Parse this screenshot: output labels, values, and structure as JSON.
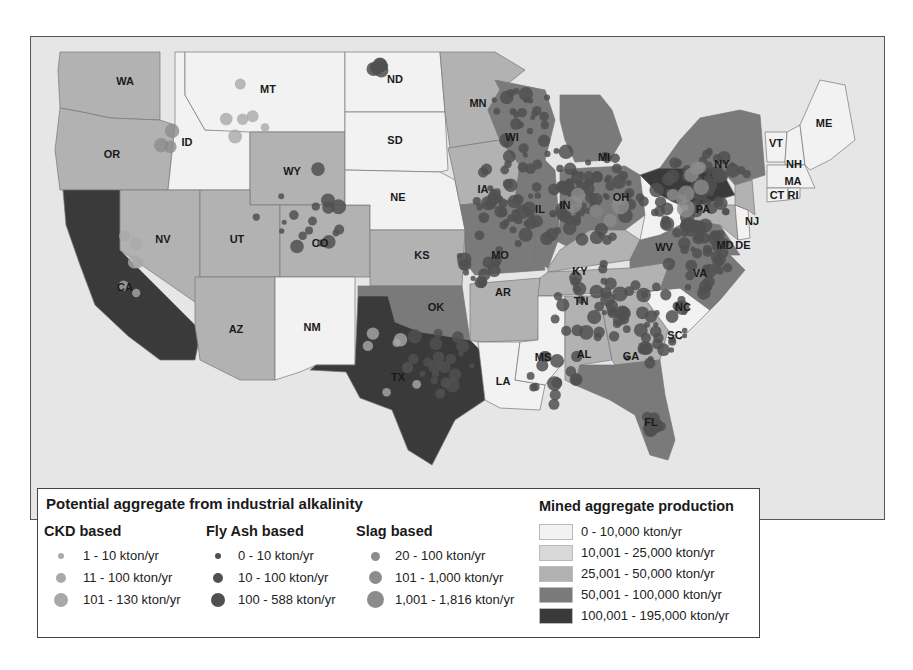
{
  "map": {
    "region": "Contiguous United States",
    "colors": {
      "background": "#e6e6e6",
      "border": "#777777",
      "cls0": "#f2f2f2",
      "cls1": "#d9d9d9",
      "cls2": "#b2b2b2",
      "cls3": "#7a7a7a",
      "cls4": "#3a3a3a",
      "ckd": "#a9a9a9",
      "flyash": "#505050",
      "slag": "#8c8c8c"
    },
    "states": [
      {
        "abbr": "WA",
        "production_class": 2
      },
      {
        "abbr": "OR",
        "production_class": 2
      },
      {
        "abbr": "CA",
        "production_class": 4
      },
      {
        "abbr": "ID",
        "production_class": 0
      },
      {
        "abbr": "NV",
        "production_class": 2
      },
      {
        "abbr": "MT",
        "production_class": 0
      },
      {
        "abbr": "WY",
        "production_class": 2
      },
      {
        "abbr": "UT",
        "production_class": 2
      },
      {
        "abbr": "CO",
        "production_class": 2
      },
      {
        "abbr": "AZ",
        "production_class": 2
      },
      {
        "abbr": "NM",
        "production_class": 0
      },
      {
        "abbr": "ND",
        "production_class": 0
      },
      {
        "abbr": "SD",
        "production_class": 0
      },
      {
        "abbr": "NE",
        "production_class": 0
      },
      {
        "abbr": "KS",
        "production_class": 2
      },
      {
        "abbr": "OK",
        "production_class": 3
      },
      {
        "abbr": "TX",
        "production_class": 4
      },
      {
        "abbr": "MN",
        "production_class": 2
      },
      {
        "abbr": "IA",
        "production_class": 2
      },
      {
        "abbr": "MO",
        "production_class": 3
      },
      {
        "abbr": "AR",
        "production_class": 2
      },
      {
        "abbr": "LA",
        "production_class": 0
      },
      {
        "abbr": "WI",
        "production_class": 3
      },
      {
        "abbr": "IL",
        "production_class": 3
      },
      {
        "abbr": "MI",
        "production_class": 3
      },
      {
        "abbr": "IN",
        "production_class": 3
      },
      {
        "abbr": "OH",
        "production_class": 3
      },
      {
        "abbr": "KY",
        "production_class": 2
      },
      {
        "abbr": "TN",
        "production_class": 2
      },
      {
        "abbr": "MS",
        "production_class": 0
      },
      {
        "abbr": "AL",
        "production_class": 2
      },
      {
        "abbr": "GA",
        "production_class": 2
      },
      {
        "abbr": "FL",
        "production_class": 3
      },
      {
        "abbr": "SC",
        "production_class": 0
      },
      {
        "abbr": "NC",
        "production_class": 3
      },
      {
        "abbr": "VA",
        "production_class": 3
      },
      {
        "abbr": "WV",
        "production_class": 0
      },
      {
        "abbr": "PA",
        "production_class": 4
      },
      {
        "abbr": "NY",
        "production_class": 3
      },
      {
        "abbr": "MD",
        "production_class": 2
      },
      {
        "abbr": "DE",
        "production_class": 0
      },
      {
        "abbr": "NJ",
        "production_class": 2
      },
      {
        "abbr": "VT",
        "production_class": 0
      },
      {
        "abbr": "NH",
        "production_class": 0
      },
      {
        "abbr": "ME",
        "production_class": 0
      },
      {
        "abbr": "MA",
        "production_class": 0
      },
      {
        "abbr": "CT",
        "production_class": 0
      },
      {
        "abbr": "RI",
        "production_class": 0
      }
    ]
  },
  "legend": {
    "industrial": {
      "title": "Potential aggregate from industrial alkalinity",
      "groups": [
        {
          "name": "CKD based",
          "type": "ckd",
          "items": [
            "1 - 10 kton/yr",
            "11 - 100 kton/yr",
            "101 - 130 kton/yr"
          ]
        },
        {
          "name": "Fly Ash based",
          "type": "flyash",
          "items": [
            "0 - 10 kton/yr",
            "10 - 100 kton/yr",
            "100 - 588 kton/yr"
          ]
        },
        {
          "name": "Slag based",
          "type": "slag",
          "items": [
            "20 - 100 kton/yr",
            "101 - 1,000 kton/yr",
            "1,001 - 1,816 kton/yr"
          ]
        }
      ]
    },
    "mined": {
      "title": "Mined aggregate production",
      "classes": [
        "0 - 10,000 kton/yr",
        "10,001 - 25,000 kton/yr",
        "25,001 - 50,000 kton/yr",
        "50,001 - 100,000 kton/yr",
        "100,001 - 195,000 kton/yr"
      ]
    }
  }
}
